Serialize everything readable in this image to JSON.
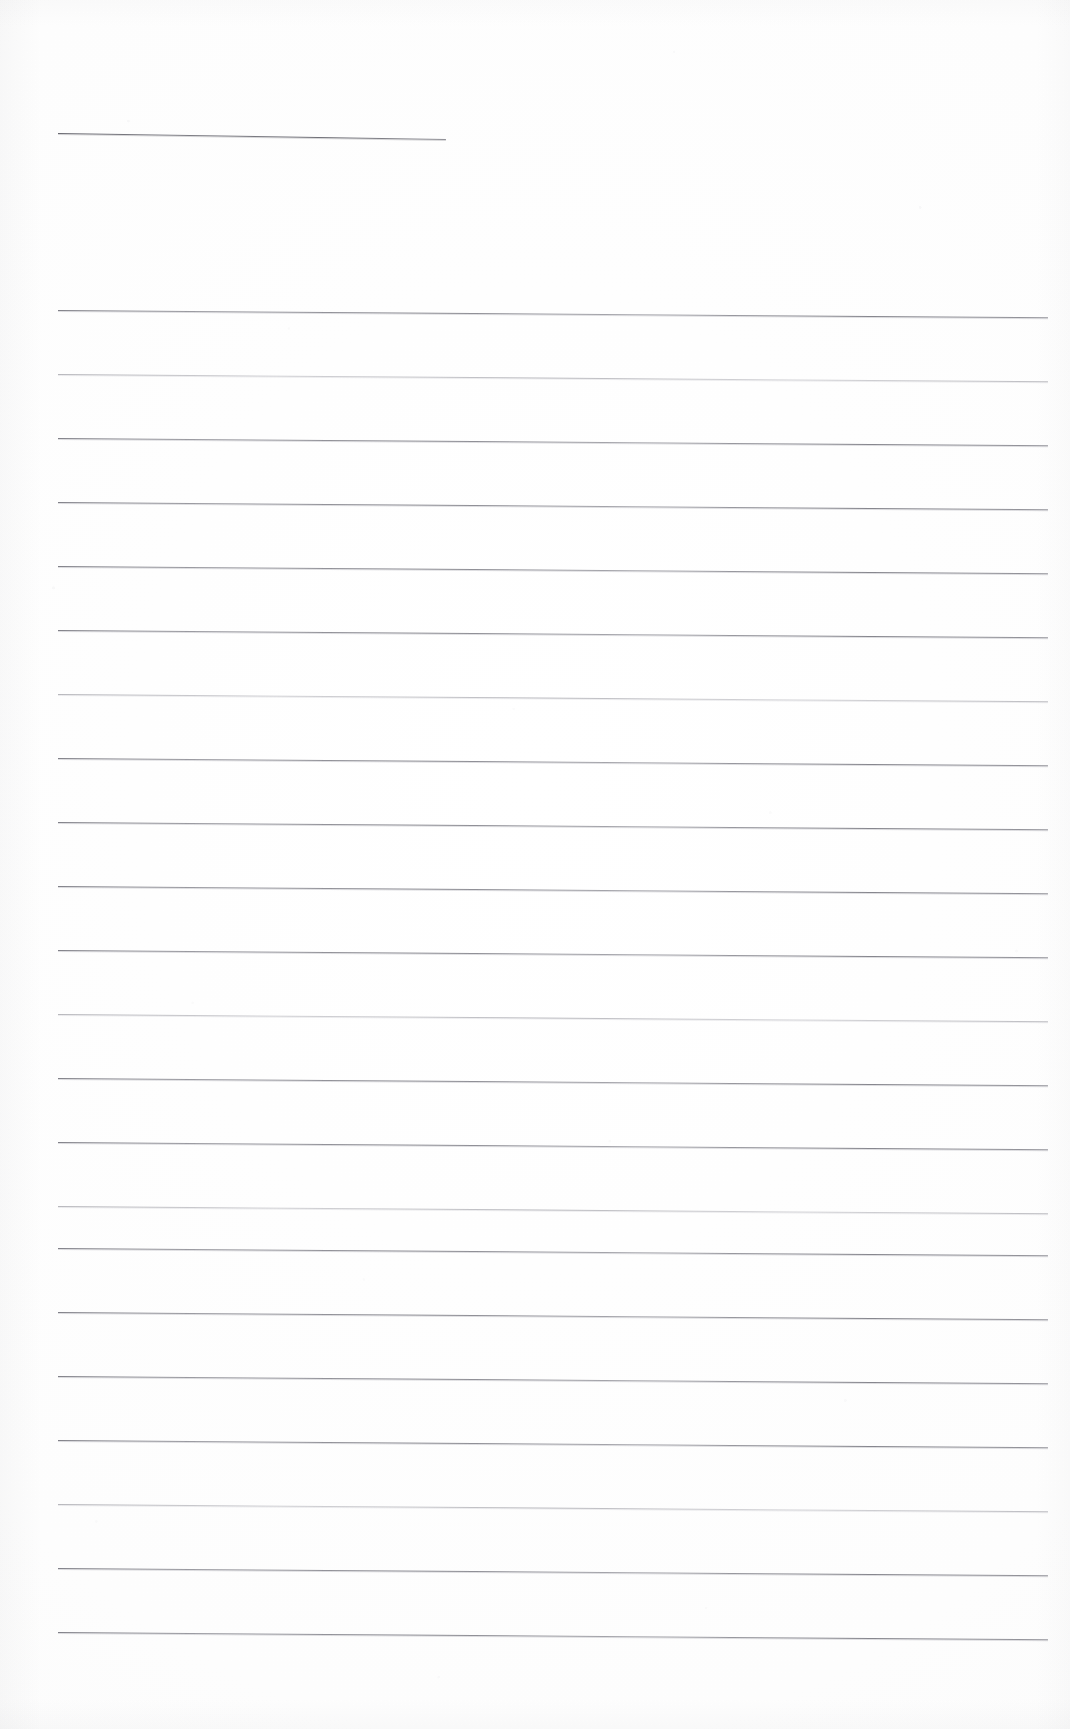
{
  "document": {
    "kind": "scanned-lined-paper",
    "title": "Blank ruled notebook page (scan)",
    "page_width": 1070,
    "page_height": 1729,
    "background_color": "#fdfdfd",
    "rule_color": "#7a7a82",
    "rule_thickness_px": 1,
    "text_content": "",
    "has_handwriting": false,
    "has_printed_text": false,
    "scan_skew_degrees": 0.35
  },
  "header_rule": {
    "name": "header-rule",
    "x": 58,
    "y": 133,
    "length": 388,
    "skew": 0.9,
    "style": "header-rule"
  },
  "ruled_lines": [
    {
      "index": 1,
      "x": 58,
      "y": 310,
      "length": 990,
      "skew": 0.42,
      "style": ""
    },
    {
      "index": 2,
      "x": 58,
      "y": 374,
      "length": 990,
      "skew": 0.42,
      "style": "faint"
    },
    {
      "index": 3,
      "x": 58,
      "y": 438,
      "length": 990,
      "skew": 0.42,
      "style": ""
    },
    {
      "index": 4,
      "x": 58,
      "y": 502,
      "length": 990,
      "skew": 0.42,
      "style": ""
    },
    {
      "index": 5,
      "x": 58,
      "y": 566,
      "length": 990,
      "skew": 0.42,
      "style": ""
    },
    {
      "index": 6,
      "x": 58,
      "y": 630,
      "length": 990,
      "skew": 0.42,
      "style": ""
    },
    {
      "index": 7,
      "x": 58,
      "y": 694,
      "length": 990,
      "skew": 0.42,
      "style": "faint"
    },
    {
      "index": 8,
      "x": 58,
      "y": 758,
      "length": 990,
      "skew": 0.42,
      "style": ""
    },
    {
      "index": 9,
      "x": 58,
      "y": 822,
      "length": 990,
      "skew": 0.42,
      "style": ""
    },
    {
      "index": 10,
      "x": 58,
      "y": 886,
      "length": 990,
      "skew": 0.42,
      "style": ""
    },
    {
      "index": 11,
      "x": 58,
      "y": 950,
      "length": 990,
      "skew": 0.42,
      "style": ""
    },
    {
      "index": 12,
      "x": 58,
      "y": 1014,
      "length": 990,
      "skew": 0.42,
      "style": "faint"
    },
    {
      "index": 13,
      "x": 58,
      "y": 1078,
      "length": 990,
      "skew": 0.42,
      "style": ""
    },
    {
      "index": 14,
      "x": 58,
      "y": 1142,
      "length": 990,
      "skew": 0.42,
      "style": ""
    },
    {
      "index": 15,
      "x": 58,
      "y": 1206,
      "length": 990,
      "skew": 0.42,
      "style": "faint"
    },
    {
      "index": 16,
      "x": 58,
      "y": 1248,
      "length": 990,
      "skew": 0.42,
      "style": ""
    },
    {
      "index": 17,
      "x": 58,
      "y": 1312,
      "length": 990,
      "skew": 0.42,
      "style": ""
    },
    {
      "index": 18,
      "x": 58,
      "y": 1376,
      "length": 990,
      "skew": 0.42,
      "style": ""
    },
    {
      "index": 19,
      "x": 58,
      "y": 1440,
      "length": 990,
      "skew": 0.42,
      "style": ""
    },
    {
      "index": 20,
      "x": 58,
      "y": 1504,
      "length": 990,
      "skew": 0.42,
      "style": "faint"
    },
    {
      "index": 21,
      "x": 58,
      "y": 1568,
      "length": 990,
      "skew": 0.42,
      "style": ""
    },
    {
      "index": 22,
      "x": 58,
      "y": 1632,
      "length": 990,
      "skew": 0.42,
      "style": ""
    }
  ]
}
